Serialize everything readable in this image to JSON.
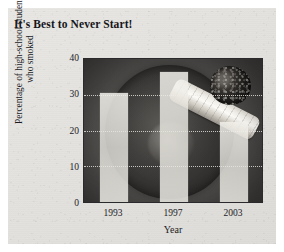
{
  "figure": {
    "title": "It's Best to Never Start!"
  },
  "chart_data": {
    "type": "bar",
    "title": "It's Best to Never Start!",
    "xlabel": "Year",
    "ylabel": "Percentage of high-school students who smoked",
    "ylabel_line1": "Percentage of high-school students",
    "ylabel_line2": "who smoked",
    "categories": [
      "1993",
      "1997",
      "2003"
    ],
    "values": [
      30,
      36,
      22
    ],
    "ylim": [
      0,
      40
    ],
    "yticks": [
      40,
      30,
      20,
      10,
      0
    ],
    "ytick_labels": [
      "40",
      "30",
      "20",
      "10",
      "0"
    ],
    "grid": true,
    "grid_axis": "y",
    "legend": null,
    "bar_color": "#efede7",
    "background": "photograph of a cigarette resting on an ashtray, greyscale"
  }
}
